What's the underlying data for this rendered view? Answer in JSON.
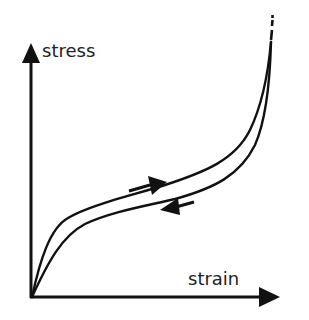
{
  "diagram": {
    "type": "stress-strain hysteresis loop",
    "axes": {
      "y_label": "stress",
      "x_label": "strain"
    },
    "curves": [
      {
        "name": "loading",
        "direction": "forward (increasing strain)"
      },
      {
        "name": "unloading",
        "direction": "reverse (decreasing strain)"
      }
    ],
    "annotations": {
      "loading_arrow": "right-pointing arrow above upper curve",
      "unloading_arrow": "left-pointing arrow below lower curve",
      "extension": "dashed continuation at top of curves"
    },
    "colors": {
      "stroke": "#111111",
      "background": "#ffffff"
    }
  }
}
